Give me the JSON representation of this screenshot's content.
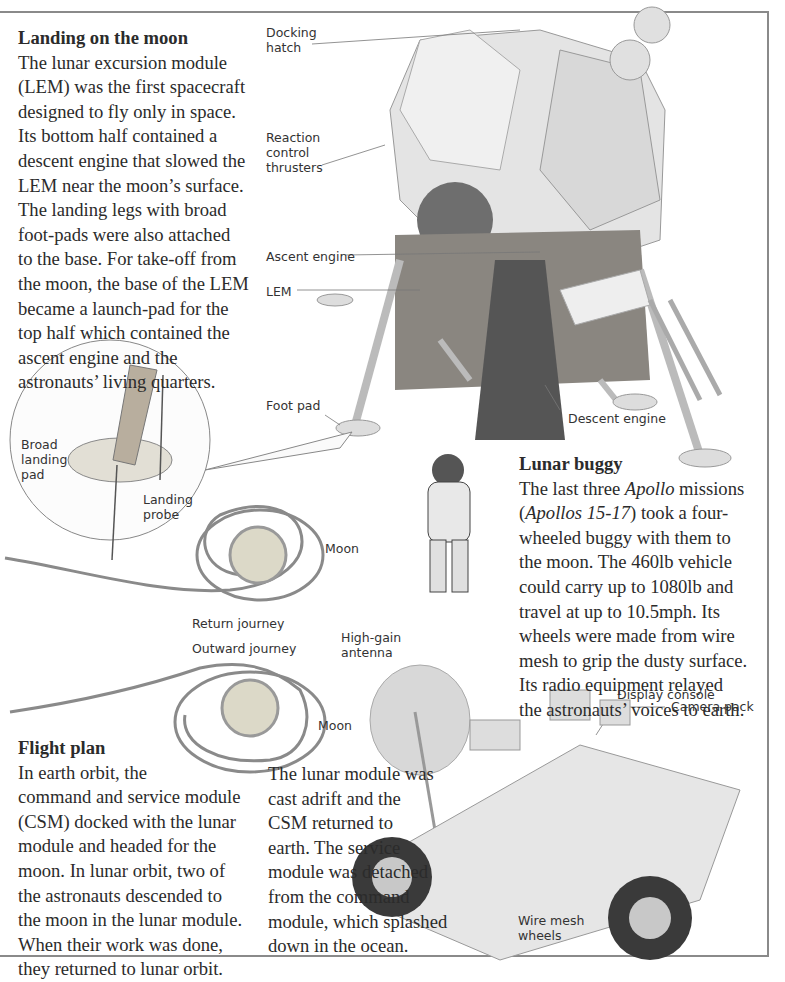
{
  "sections": {
    "landing": {
      "title": "Landing on the moon",
      "lines": [
        "The lunar excursion module",
        "(LEM) was the first spacecraft",
        "designed to fly only in space.",
        "Its bottom half contained a",
        "descent engine that slowed the",
        "LEM near the moon’s surface.",
        "The landing legs with broad",
        "foot-pads were also attached",
        "to the base. For take-off from",
        "the moon, the base of the LEM",
        "became a launch-pad for the",
        "top half which contained the",
        "ascent engine and the",
        "astronauts’ living quarters."
      ]
    },
    "buggy": {
      "title": "Lunar buggy",
      "line1_pre": "The last three ",
      "line1_em": "Apollo",
      "line1_post": " missions",
      "line2_pre": "(",
      "line2_em": "Apollos 15-17",
      "line2_post": ") took a four-",
      "lines": [
        "wheeled buggy with them to",
        "the moon. The 460lb vehicle",
        "could carry up to 1080lb and",
        "travel at up to 10.5mph. Its",
        "wheels were made from wire",
        "mesh to grip the dusty surface.",
        "Its radio equipment relayed",
        "the astronauts’ voices to earth."
      ]
    },
    "flight_plan": {
      "title": "Flight plan",
      "lines": [
        "In earth orbit, the",
        "command and service module",
        "(CSM) docked with the lunar",
        "module and headed for the",
        "moon. In lunar orbit, two of",
        "the astronauts descended to",
        "the moon in the lunar module.",
        "When their work was done,",
        "they  returned to lunar orbit."
      ]
    },
    "return": {
      "lines": [
        "The lunar module was",
        "cast adrift and the",
        "CSM returned to",
        "earth. The service",
        "module was detached",
        "from the command",
        "module, which splashed",
        "down in the ocean."
      ]
    }
  },
  "labels": {
    "docking_hatch": "Docking\nhatch",
    "reaction_control": "Reaction\ncontrol\nthrusters",
    "ascent_engine": "Ascent engine",
    "lem": "LEM",
    "foot_pad": "Foot pad",
    "descent_engine": "Descent engine",
    "broad_landing_pad": "Broad\nlanding\npad",
    "landing_probe": "Landing\nprobe",
    "moon_1": "Moon",
    "return_journey": "Return journey",
    "outward_journey": "Outward journey",
    "moon_2": "Moon",
    "high_gain_antenna": "High-gain\nantenna",
    "display_console": "Display console",
    "camera_pack": "Camera pack",
    "wire_mesh_wheels": "Wire mesh\nwheels"
  }
}
